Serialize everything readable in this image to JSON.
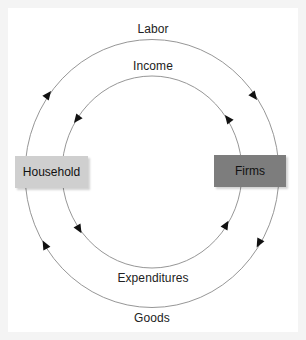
{
  "diagram": {
    "type": "circular-flow",
    "nodes": [
      {
        "id": "household",
        "label": "Household",
        "fill": "#cfcfcf"
      },
      {
        "id": "firms",
        "label": "Firms",
        "fill": "#7d7d7d"
      }
    ],
    "flows": [
      {
        "id": "labor",
        "label": "Labor",
        "ring": "outer",
        "from": "household",
        "to": "firms",
        "path": "top"
      },
      {
        "id": "goods",
        "label": "Goods",
        "ring": "outer",
        "from": "firms",
        "to": "household",
        "path": "bottom"
      },
      {
        "id": "income",
        "label": "Income",
        "ring": "inner",
        "from": "firms",
        "to": "household",
        "path": "top"
      },
      {
        "id": "expenditures",
        "label": "Expenditures",
        "ring": "inner",
        "from": "household",
        "to": "firms",
        "path": "bottom"
      }
    ],
    "colors": {
      "background": "#f4f4f4",
      "canvas": "#ffffff",
      "line": "#8a8a8a",
      "arrow": "#111111",
      "household_box": "#cfcfcf",
      "firms_box": "#7d7d7d"
    }
  }
}
